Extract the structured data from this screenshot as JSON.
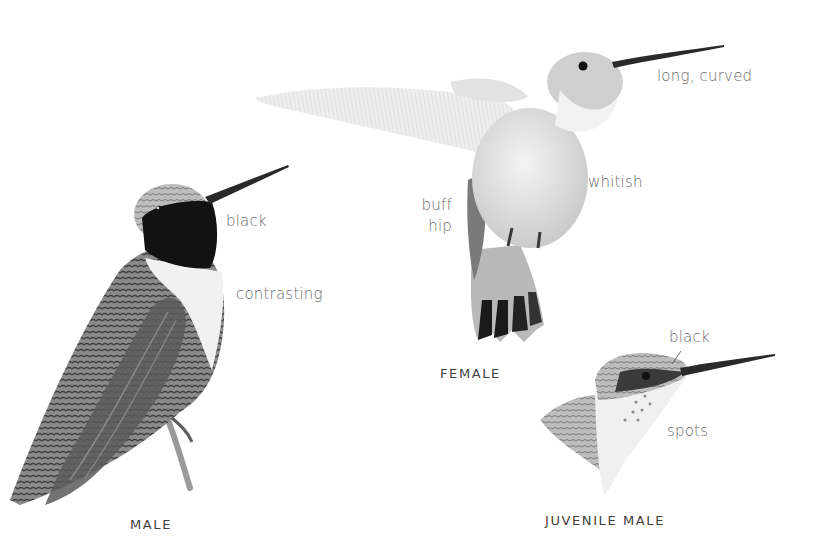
{
  "figures": {
    "male": {
      "title": "MALE",
      "annotations": {
        "throat": "black",
        "collar": "contrasting"
      }
    },
    "female": {
      "title": "FEMALE",
      "annotations": {
        "bill": "long, curved",
        "underparts": "whitish",
        "hip_line1": "buff",
        "hip_line2": "hip"
      }
    },
    "juvenile_male": {
      "title": "JUVENILE MALE",
      "annotations": {
        "eye_line": "black",
        "throat": "spots"
      }
    }
  },
  "colors": {
    "background": "#ffffff",
    "label_text": "#6b6b6b",
    "title_text": "#3f3f3f",
    "ink_dark": "#111111",
    "ink_mid": "#6e6e6e",
    "ink_light": "#cfcfcf"
  }
}
